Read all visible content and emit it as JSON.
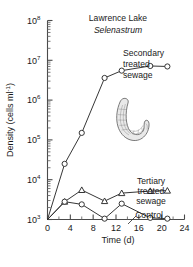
{
  "chart_data": {
    "type": "line",
    "title": "Lawrence Lake",
    "subtitle": "Selenastrum",
    "xlabel": "Time (d)",
    "ylabel": "Density (cells ml",
    "ylabel_exponent": "-1",
    "ylabel_suffix": ")",
    "yscale": "log",
    "ylim": [
      1000,
      100000000
    ],
    "xlim": [
      0,
      24
    ],
    "xticks": [
      0,
      4,
      8,
      12,
      16,
      20,
      24
    ],
    "xtick_labels": [
      "0",
      "4",
      "8",
      "12",
      "16",
      "20",
      "24"
    ],
    "yticks": [
      1000,
      10000,
      100000,
      1000000,
      10000000,
      100000000
    ],
    "ytick_mantissa": "10",
    "ytick_exponents": [
      "3",
      "4",
      "5",
      "6",
      "7",
      "8"
    ],
    "grid": false,
    "legend_position": "inline-annotations",
    "series": [
      {
        "name": "Secondary treated sewage",
        "marker": "circle",
        "x": [
          0,
          3,
          6,
          10,
          13,
          18,
          21
        ],
        "y": [
          1000,
          25000,
          150000,
          3600000,
          5500000,
          7200000,
          7000000
        ]
      },
      {
        "name": "Tertiary treated sewage",
        "marker": "triangle",
        "x": [
          0,
          3,
          6,
          10,
          13,
          18,
          21
        ],
        "y": [
          1000,
          2800,
          5500,
          2900,
          4600,
          5200,
          5300
        ]
      },
      {
        "name": "Control",
        "marker": "circle",
        "x": [
          0,
          3,
          6,
          10,
          13,
          18,
          21
        ],
        "y": [
          1000,
          2800,
          2400,
          1050,
          2500,
          1100,
          1050
        ]
      }
    ],
    "annotations": [
      {
        "id": "secondary",
        "lines": [
          "Secondary",
          "treated",
          "sewage"
        ]
      },
      {
        "id": "tertiary",
        "lines": [
          "Tertiary",
          "treated",
          "sewage"
        ]
      },
      {
        "id": "control",
        "lines": [
          "Control"
        ]
      }
    ],
    "inset_drawing": "selenastrum-crescent-cell"
  }
}
